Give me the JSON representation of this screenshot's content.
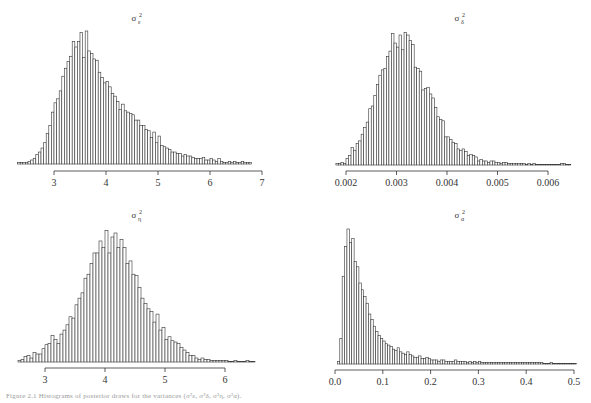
{
  "figure": {
    "caption": "Figure 2.1  Histograms of posterior draws for the variances (σ²ε, σ²δ, σ²η, σ²α)."
  },
  "style": {
    "bar_fill": "#ffffff",
    "bar_stroke": "#333333",
    "axis_color": "#333333"
  },
  "chart_data": [
    {
      "type": "bar",
      "title": "σ²ε",
      "title_base": "σ",
      "title_sup": "2",
      "title_sub": "ε",
      "xlabel": "",
      "ylabel": "",
      "xticks": [
        3,
        4,
        5,
        6,
        7
      ],
      "xtick_labels": [
        "3",
        "4",
        "5",
        "6",
        "7"
      ],
      "xlim": [
        2.3,
        6.85
      ],
      "bin_start": 2.3,
      "bin_width": 0.05,
      "grid": false,
      "values": [
        0.01,
        0.01,
        0.01,
        0.01,
        0.02,
        0.03,
        0.04,
        0.07,
        0.09,
        0.12,
        0.16,
        0.23,
        0.29,
        0.39,
        0.46,
        0.49,
        0.55,
        0.66,
        0.72,
        0.77,
        0.81,
        0.92,
        0.88,
        0.92,
        0.99,
        0.8,
        1.0,
        0.85,
        0.83,
        0.79,
        0.78,
        0.69,
        0.65,
        0.61,
        0.62,
        0.58,
        0.53,
        0.51,
        0.47,
        0.41,
        0.45,
        0.4,
        0.39,
        0.38,
        0.37,
        0.33,
        0.33,
        0.29,
        0.29,
        0.26,
        0.25,
        0.2,
        0.24,
        0.16,
        0.21,
        0.14,
        0.13,
        0.12,
        0.11,
        0.09,
        0.09,
        0.08,
        0.08,
        0.06,
        0.07,
        0.06,
        0.06,
        0.05,
        0.04,
        0.04,
        0.04,
        0.05,
        0.03,
        0.03,
        0.04,
        0.03,
        0.02,
        0.04,
        0.02,
        0.01,
        0.01,
        0.02,
        0.01,
        0.02,
        0.01,
        0.01,
        0.02,
        0.01,
        0.01,
        0.01
      ],
      "layout": {
        "x0": 54,
        "x_unit_px": 52,
        "x_origin": 3,
        "baseline_y": 164,
        "peak_y": 31,
        "axis_y": 171,
        "title_x": 134,
        "title_y": 15,
        "axis_from": 3,
        "axis_to": 7
      }
    },
    {
      "type": "bar",
      "title": "σ²δ",
      "title_base": "σ",
      "title_sup": "2",
      "title_sub": "δ",
      "xlabel": "",
      "ylabel": "",
      "xticks": [
        0.002,
        0.003,
        0.004,
        0.005,
        0.006
      ],
      "xtick_labels": [
        "0.002",
        "0.003",
        "0.004",
        "0.005",
        "0.006"
      ],
      "xlim": [
        0.0018,
        0.00645
      ],
      "bin_start": 0.0018,
      "bin_width": 5e-05,
      "grid": false,
      "values": [
        0.01,
        0.01,
        0.02,
        0.01,
        0.05,
        0.07,
        0.13,
        0.11,
        0.16,
        0.18,
        0.23,
        0.28,
        0.32,
        0.42,
        0.44,
        0.52,
        0.6,
        0.67,
        0.71,
        0.72,
        0.81,
        0.85,
        0.98,
        0.91,
        0.88,
        0.97,
        0.86,
        0.99,
        0.97,
        0.93,
        0.9,
        0.73,
        0.72,
        0.7,
        0.56,
        0.57,
        0.58,
        0.53,
        0.5,
        0.43,
        0.36,
        0.34,
        0.33,
        0.21,
        0.21,
        0.19,
        0.17,
        0.16,
        0.12,
        0.11,
        0.12,
        0.1,
        0.07,
        0.08,
        0.07,
        0.06,
        0.03,
        0.04,
        0.03,
        0.03,
        0.02,
        0.03,
        0.03,
        0.02,
        0.02,
        0.01,
        0.02,
        0.02,
        0.01,
        0.01,
        0.01,
        0.01,
        0.01,
        0.01,
        0.01,
        0.0,
        0.01,
        0.0,
        0.01,
        0.0,
        0.0,
        0.0,
        0.0,
        0.0,
        0.0,
        0.0,
        0.0,
        0.0,
        0.0,
        0.01,
        0.01,
        0.0,
        0.0
      ],
      "layout": {
        "x0": 346,
        "x_unit_px": 50500,
        "x_origin": 0.002,
        "baseline_y": 165,
        "peak_y": 31,
        "axis_y": 171,
        "title_x": 457,
        "title_y": 15,
        "axis_from": 0.002,
        "axis_to": 0.006
      }
    },
    {
      "type": "bar",
      "title": "σ²η",
      "title_base": "σ",
      "title_sup": "2",
      "title_sub": "η",
      "xlabel": "",
      "ylabel": "",
      "xticks": [
        3,
        4,
        5,
        6
      ],
      "xtick_labels": [
        "3",
        "4",
        "5",
        "6"
      ],
      "xlim": [
        2.55,
        6.5
      ],
      "bin_start": 2.55,
      "bin_width": 0.05,
      "grid": false,
      "values": [
        0.01,
        0.02,
        0.04,
        0.05,
        0.03,
        0.07,
        0.06,
        0.06,
        0.1,
        0.13,
        0.14,
        0.2,
        0.17,
        0.14,
        0.21,
        0.24,
        0.28,
        0.34,
        0.33,
        0.43,
        0.48,
        0.52,
        0.63,
        0.66,
        0.74,
        0.82,
        0.82,
        0.91,
        0.86,
        0.99,
        0.82,
        0.94,
        0.97,
        0.86,
        0.92,
        0.86,
        0.74,
        0.76,
        0.66,
        0.65,
        0.56,
        0.48,
        0.44,
        0.4,
        0.38,
        0.3,
        0.36,
        0.24,
        0.26,
        0.17,
        0.19,
        0.16,
        0.15,
        0.14,
        0.11,
        0.09,
        0.07,
        0.05,
        0.05,
        0.03,
        0.02,
        0.03,
        0.02,
        0.02,
        0.01,
        0.01,
        0.01,
        0.01,
        0.01,
        0.01,
        0.0,
        0.0,
        0.01,
        0.0,
        0.0,
        0.0,
        0.01,
        0.0,
        0.0
      ],
      "layout": {
        "x0": 45,
        "x_unit_px": 60,
        "x_origin": 3,
        "baseline_y": 362,
        "peak_y": 229,
        "axis_y": 368,
        "title_x": 134,
        "title_y": 212,
        "axis_from": 3,
        "axis_to": 6
      }
    },
    {
      "type": "bar",
      "title": "σ²α",
      "title_base": "σ",
      "title_sup": "2",
      "title_sub": "α",
      "xlabel": "",
      "ylabel": "",
      "xticks": [
        0.0,
        0.1,
        0.2,
        0.3,
        0.4,
        0.5
      ],
      "xtick_labels": [
        "0.0",
        "0.1",
        "0.2",
        "0.3",
        "0.4",
        "0.5"
      ],
      "xlim": [
        0.0,
        0.5
      ],
      "bin_start": 0.005,
      "bin_width": 0.005,
      "grid": false,
      "values": [
        0.02,
        0.19,
        0.65,
        0.87,
        1.0,
        0.9,
        0.93,
        0.76,
        0.72,
        0.6,
        0.55,
        0.5,
        0.45,
        0.37,
        0.33,
        0.28,
        0.24,
        0.21,
        0.19,
        0.17,
        0.15,
        0.14,
        0.13,
        0.11,
        0.1,
        0.12,
        0.09,
        0.08,
        0.07,
        0.09,
        0.07,
        0.06,
        0.05,
        0.05,
        0.06,
        0.04,
        0.04,
        0.05,
        0.04,
        0.03,
        0.03,
        0.03,
        0.02,
        0.03,
        0.03,
        0.02,
        0.02,
        0.02,
        0.02,
        0.03,
        0.02,
        0.02,
        0.02,
        0.02,
        0.01,
        0.02,
        0.01,
        0.02,
        0.01,
        0.02,
        0.01,
        0.01,
        0.01,
        0.01,
        0.01,
        0.01,
        0.01,
        0.01,
        0.01,
        0.01,
        0.01,
        0.01,
        0.01,
        0.01,
        0.01,
        0.01,
        0.01,
        0.01,
        0.01,
        0.01,
        0.01,
        0.01,
        0.01,
        0.01,
        0.01,
        0.01,
        0.0,
        0.0,
        0.0,
        0.01,
        0.0,
        0.0,
        0.0,
        0.0,
        0.0,
        0.0,
        0.0,
        0.0,
        0.0,
        0.0
      ],
      "layout": {
        "x0": 335,
        "x_unit_px": 478,
        "x_origin": 0.0,
        "baseline_y": 364,
        "peak_y": 229,
        "axis_y": 370,
        "title_x": 457,
        "title_y": 212,
        "axis_from": 0.0,
        "axis_to": 0.5
      }
    }
  ]
}
